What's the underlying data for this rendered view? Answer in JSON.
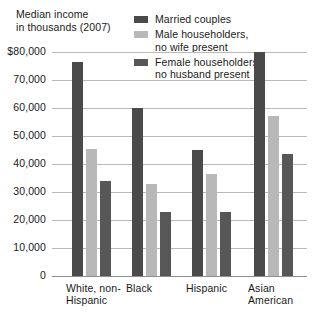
{
  "title": {
    "line1": "Median income",
    "line2": "in thousands (2007)"
  },
  "legend": {
    "items": [
      {
        "label": "Married couples",
        "color": "#4a4a4a"
      },
      {
        "label": "Male householders,\nno wife present",
        "color": "#b8b8b8"
      },
      {
        "label": "Female householders,\nno husband present",
        "color": "#575757"
      }
    ]
  },
  "yaxis": {
    "ticks": [
      "$80,000",
      "70,000",
      "60,000",
      "50,000",
      "40,000",
      "30,000",
      "20,000",
      "10,000",
      "0"
    ]
  },
  "xaxis": {
    "labels": [
      "White, non-\nHispanic",
      "Black",
      "Hispanic",
      "Asian\nAmerican"
    ]
  },
  "chart_data": {
    "type": "bar",
    "title": "Median income in thousands (2007)",
    "xlabel": "",
    "ylabel": "Median income in thousands (2007)",
    "ylim": [
      0,
      80000
    ],
    "ytick_values": [
      0,
      10000,
      20000,
      30000,
      40000,
      50000,
      60000,
      70000,
      80000
    ],
    "ytick_labels": [
      "0",
      "10,000",
      "20,000",
      "30,000",
      "40,000",
      "50,000",
      "60,000",
      "70,000",
      "$80,000"
    ],
    "grid": true,
    "legend_position": "top-right",
    "categories": [
      "White, non-Hispanic",
      "Black",
      "Hispanic",
      "Asian American"
    ],
    "series": [
      {
        "name": "Married couples",
        "color": "#4a4a4a",
        "values": [
          76500,
          60000,
          45000,
          80000
        ]
      },
      {
        "name": "Male householders, no wife present",
        "color": "#b8b8b8",
        "values": [
          45500,
          33000,
          36500,
          57000
        ]
      },
      {
        "name": "Female householders, no husband present",
        "color": "#575757",
        "values": [
          34000,
          23000,
          23000,
          43500
        ]
      }
    ]
  },
  "layout": {
    "group_x": [
      20,
      80,
      140,
      202
    ],
    "bar_width": 11,
    "bar_gap": 3
  }
}
